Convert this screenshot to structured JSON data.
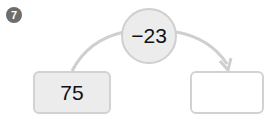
{
  "problem": {
    "number": "7"
  },
  "diagram": {
    "operation": "−23",
    "start_value": "75",
    "result_value": "",
    "colors": {
      "badge": "#6d6d6d",
      "node_fill": "#ececec",
      "node_border": "#cfcfcf",
      "connector": "#cfcfcf"
    }
  }
}
